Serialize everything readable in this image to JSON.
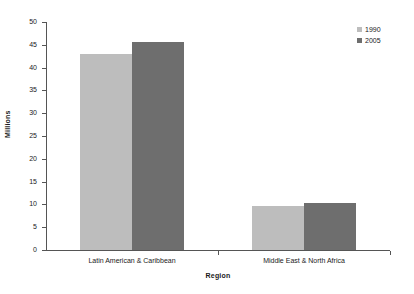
{
  "chart_data": {
    "type": "bar",
    "title": "",
    "subtitle": "",
    "xlabel": "Region",
    "ylabel": "Millions",
    "categories": [
      "Latin American & Caribbean",
      "Middle East & North Africa"
    ],
    "series": [
      {
        "name": "1990",
        "values": [
          43.0,
          9.7
        ],
        "color": "#bdbdbd"
      },
      {
        "name": "2005",
        "values": [
          45.7,
          10.4
        ],
        "color": "#6e6e6e"
      }
    ],
    "ylim": [
      0,
      50
    ],
    "yticks": [
      0,
      5,
      10,
      15,
      20,
      25,
      30,
      35,
      40,
      45,
      50
    ],
    "ytick_labels": [
      "0",
      "5",
      "10",
      "15",
      "20",
      "25",
      "30",
      "35",
      "40",
      "45",
      "50"
    ],
    "grid": false,
    "legend_position": "top-right",
    "legend_entries": [
      "1990",
      "2005"
    ],
    "axis_color": "#555555",
    "background": "#ffffff"
  }
}
